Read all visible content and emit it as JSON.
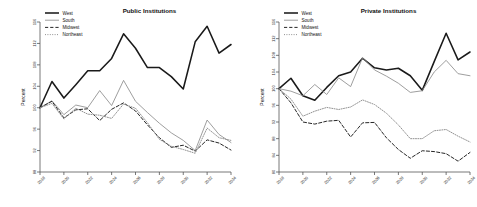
{
  "figure": {
    "ylabel": "Percent",
    "legend_position": "top-left",
    "legend_entries": [
      {
        "label": "West",
        "style": "solid-thick",
        "color": "#1a1a1a"
      },
      {
        "label": "South",
        "style": "solid-thin",
        "color": "#8c8c8c"
      },
      {
        "label": "Midwest",
        "style": "dashed",
        "color": "#1a1a1a"
      },
      {
        "label": "Northeast",
        "style": "dotted",
        "color": "#8c8c8c"
      }
    ]
  },
  "chart_data": [
    {
      "type": "line",
      "title": "Public Institutions",
      "xlabel": "",
      "ylabel": "Percent",
      "grid": false,
      "legend": [
        "West",
        "South",
        "Midwest",
        "Northeast"
      ],
      "legend_position": "top-left",
      "xlim": [
        2018,
        2034
      ],
      "ylim": [
        88,
        116
      ],
      "xticks": [
        2018,
        2020,
        2022,
        2024,
        2026,
        2028,
        2030,
        2032,
        2034
      ],
      "yticks": [
        88,
        92,
        96,
        100,
        104,
        108,
        112,
        116
      ],
      "x": [
        2018,
        2019,
        2020,
        2021,
        2022,
        2023,
        2024,
        2025,
        2026,
        2027,
        2028,
        2029,
        2030,
        2031,
        2032,
        2033,
        2034
      ],
      "series": [
        {
          "name": "West",
          "values": [
            100.0,
            104.9,
            101.8,
            104.3,
            106.9,
            106.9,
            109.2,
            113.8,
            111.1,
            107.5,
            107.5,
            105.8,
            103.5,
            112.3,
            115.2,
            110.2,
            111.8
          ]
        },
        {
          "name": "South",
          "values": [
            100.0,
            101.3,
            98.7,
            100.5,
            100.0,
            103.2,
            100.4,
            105.1,
            101.2,
            99.1,
            97.1,
            95.3,
            93.9,
            92.0,
            97.7,
            95.0,
            93.5
          ]
        },
        {
          "name": "Midwest",
          "values": [
            100.0,
            101.2,
            98.1,
            99.6,
            99.8,
            97.6,
            99.7,
            100.9,
            99.4,
            96.8,
            94.4,
            92.6,
            93.0,
            91.9,
            94.0,
            93.4,
            92.1
          ]
        },
        {
          "name": "Northeast",
          "values": [
            100.0,
            100.8,
            97.9,
            99.9,
            98.8,
            98.6,
            98.0,
            100.7,
            99.9,
            97.2,
            94.1,
            92.8,
            92.2,
            91.5,
            96.2,
            94.4,
            93.9
          ]
        }
      ]
    },
    {
      "type": "line",
      "title": "Private Institutions",
      "xlabel": "",
      "ylabel": "Percent",
      "grid": false,
      "legend": [
        "West",
        "South",
        "Midwest",
        "Northeast"
      ],
      "legend_position": "top-left",
      "xlim": [
        2018,
        2034
      ],
      "ylim": [
        80,
        116
      ],
      "xticks": [
        2018,
        2020,
        2022,
        2024,
        2026,
        2028,
        2030,
        2032,
        2034
      ],
      "yticks": [
        80,
        84,
        88,
        92,
        96,
        100,
        104,
        108,
        112,
        116
      ],
      "x": [
        2018,
        2019,
        2020,
        2021,
        2022,
        2023,
        2024,
        2025,
        2026,
        2027,
        2028,
        2029,
        2030,
        2031,
        2032,
        2033,
        2034
      ],
      "series": [
        {
          "name": "West",
          "values": [
            100.0,
            102.5,
            98.3,
            97.2,
            100.3,
            103.1,
            104.0,
            107.3,
            105.0,
            104.5,
            104.9,
            103.1,
            99.6,
            106.5,
            113.3,
            106.9,
            108.8
          ]
        },
        {
          "name": "South",
          "values": [
            100.0,
            99.4,
            98.3,
            101.0,
            98.6,
            102.6,
            100.5,
            107.4,
            104.5,
            103.0,
            101.3,
            99.1,
            99.5,
            104.0,
            106.8,
            103.6,
            103.1
          ]
        },
        {
          "name": "Midwest",
          "values": [
            100.0,
            96.6,
            92.0,
            91.5,
            92.2,
            92.4,
            88.4,
            91.8,
            91.9,
            88.2,
            85.4,
            83.3,
            85.1,
            84.9,
            84.4,
            82.6,
            84.7
          ]
        },
        {
          "name": "Northeast",
          "values": [
            100.0,
            97.5,
            93.4,
            94.6,
            95.5,
            95.0,
            95.6,
            97.3,
            96.2,
            94.1,
            91.3,
            88.0,
            88.0,
            89.9,
            90.2,
            88.6,
            87.2
          ]
        }
      ]
    }
  ]
}
